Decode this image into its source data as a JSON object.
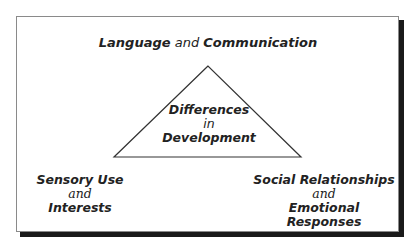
{
  "diagram": {
    "top": {
      "part1": "Language",
      "connector": "and",
      "part2": "Communication"
    },
    "center": {
      "line1": "Differences",
      "line2": "in",
      "line3": "Development"
    },
    "bottom_left": {
      "line1": "Sensory Use",
      "line2": "and",
      "line3": "Interests"
    },
    "bottom_right": {
      "line1": "Social Relationships",
      "line2": "and",
      "line3": "Emotional Responses"
    }
  }
}
